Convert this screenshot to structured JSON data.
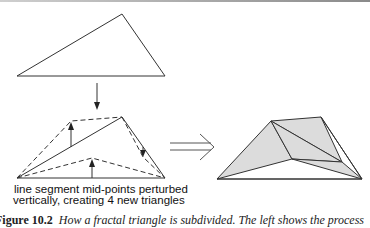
{
  "figure": {
    "label_line1": "line segment mid-points perturbed",
    "label_line2": "vertically, creating 4 new triangles",
    "caption_number": "Figure 10.2",
    "caption_text": "How a fractal triangle is subdivided. The left shows the process",
    "colors": {
      "stroke": "#222222",
      "fill": "#dcdcdc",
      "background": "#ffffff"
    },
    "original_triangle": {
      "vertices": [
        [
          17,
          76
        ],
        [
          165,
          76
        ],
        [
          122,
          14
        ]
      ]
    },
    "perturbed_triangle": {
      "vertices": [
        [
          17,
          178
        ],
        [
          165,
          178
        ],
        [
          122,
          117
        ]
      ],
      "perturbed_midpoints": [
        [
          71,
          121
        ],
        [
          92,
          158
        ],
        [
          143,
          157
        ]
      ]
    },
    "subdivided_triangle": {
      "vertices": [
        [
          217,
          179
        ],
        [
          362,
          179
        ],
        [
          321,
          117
        ]
      ],
      "midpoints": [
        [
          271,
          121
        ],
        [
          292,
          159
        ],
        [
          342,
          162
        ]
      ],
      "shaded_triangles": 4
    }
  }
}
